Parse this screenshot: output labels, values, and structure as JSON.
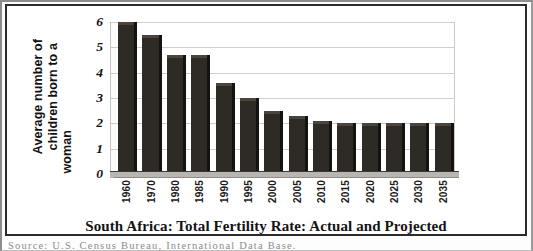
{
  "chart_data": {
    "type": "bar",
    "title": "South Africa: Total Fertility Rate: Actual and Projected",
    "xlabel": "",
    "ylabel": "Average number of children born to a woman",
    "ylim": [
      0,
      6
    ],
    "ytick_values": [
      0,
      1,
      2,
      3,
      4,
      5,
      6
    ],
    "ytick_labels": [
      "0",
      "1",
      "2",
      "3",
      "4",
      "5",
      "6"
    ],
    "grid": true,
    "legend": "none",
    "style": "3d-column",
    "bar_color": "#2e2a26",
    "categories": [
      "1960",
      "1970",
      "1980",
      "1985",
      "1990",
      "1995",
      "2000",
      "2005",
      "2010",
      "2015",
      "2020",
      "2025",
      "2030",
      "2035"
    ],
    "values": [
      6.0,
      5.5,
      4.7,
      4.7,
      3.6,
      3.0,
      2.5,
      2.3,
      2.1,
      2.0,
      2.0,
      2.0,
      2.0,
      2.0
    ]
  },
  "y_axis_title_lines": [
    "Average number of",
    "children born to a",
    "woman"
  ],
  "source": {
    "text": "Source: U.S. Census Bureau, International Data Base."
  },
  "colors": {
    "bar": "#2e2a26",
    "bar_top": "#4a443d",
    "bar_side": "#15120f",
    "gridline": "#cfcfcf",
    "frame": "#2b2b2b",
    "page_edge": "#8d8d8d"
  }
}
